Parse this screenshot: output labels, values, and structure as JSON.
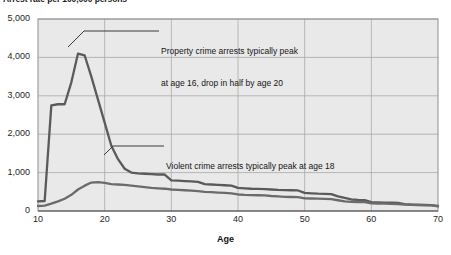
{
  "chart_data": {
    "type": "line",
    "title": "Arrest rate per 100,000 persons",
    "xlabel": "Age",
    "ylabel": "",
    "xlim": [
      10,
      70
    ],
    "ylim": [
      0,
      5000
    ],
    "grid": true,
    "legend": "none",
    "xticks": [
      "10",
      "20",
      "30",
      "40",
      "50",
      "60",
      "70"
    ],
    "yticks": [
      "0",
      "1,000",
      "2,000",
      "3,000",
      "4,000",
      "5,000"
    ],
    "x": [
      10,
      11,
      12,
      13,
      14,
      15,
      16,
      17,
      18,
      19,
      20,
      21,
      22,
      23,
      24,
      25,
      26,
      27,
      28,
      29,
      30,
      31,
      32,
      33,
      34,
      35,
      36,
      37,
      38,
      39,
      40,
      41,
      42,
      43,
      44,
      45,
      46,
      47,
      48,
      49,
      50,
      51,
      52,
      53,
      54,
      55,
      56,
      57,
      58,
      59,
      60,
      61,
      62,
      63,
      64,
      65,
      66,
      67,
      68,
      69,
      70
    ],
    "series": [
      {
        "name": "Property crime",
        "color": "#5a5a5a",
        "values": [
          250,
          260,
          2750,
          2780,
          2780,
          3350,
          4100,
          4050,
          3500,
          2900,
          2300,
          1700,
          1350,
          1100,
          1000,
          980,
          970,
          960,
          950,
          950,
          800,
          790,
          780,
          770,
          760,
          700,
          690,
          680,
          670,
          660,
          600,
          590,
          580,
          575,
          570,
          560,
          550,
          545,
          540,
          535,
          470,
          460,
          450,
          445,
          440,
          380,
          340,
          300,
          290,
          285,
          230,
          225,
          220,
          215,
          210,
          180,
          170,
          165,
          160,
          155,
          130
        ]
      },
      {
        "name": "Violent crime",
        "color": "#6b6b6b",
        "values": [
          130,
          140,
          190,
          250,
          320,
          420,
          560,
          660,
          740,
          750,
          730,
          700,
          690,
          680,
          660,
          640,
          620,
          600,
          590,
          580,
          560,
          550,
          540,
          530,
          520,
          500,
          490,
          480,
          470,
          460,
          430,
          420,
          415,
          410,
          405,
          390,
          380,
          370,
          365,
          360,
          330,
          325,
          320,
          315,
          310,
          280,
          250,
          240,
          235,
          230,
          200,
          195,
          190,
          185,
          180,
          165,
          160,
          155,
          150,
          145,
          120
        ]
      }
    ],
    "annotations": [
      {
        "name": "property-peak-note",
        "line1": "Property crime arrests typically peak",
        "line2": "at age 16, drop in half by age 20"
      },
      {
        "name": "violent-peak-note",
        "line1": "Violent crime arrests typically peak at age 18"
      }
    ]
  }
}
